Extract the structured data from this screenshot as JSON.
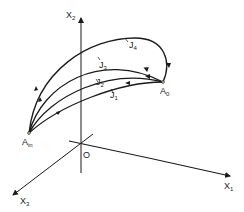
{
  "diagram": {
    "axes": {
      "x1": {
        "label": "X",
        "sub": "1"
      },
      "x2": {
        "label": "X",
        "sub": "2"
      },
      "x3": {
        "label": "X",
        "sub": "3"
      },
      "origin": {
        "label": "O"
      }
    },
    "points": {
      "a_in": {
        "label": "A",
        "sub": "in"
      },
      "a_0": {
        "label": "A",
        "sub": "0"
      }
    },
    "curves": [
      {
        "label": "J",
        "sub": "1"
      },
      {
        "label": "J",
        "sub": "2"
      },
      {
        "label": "J",
        "sub": "3"
      },
      {
        "label": "J",
        "sub": "4"
      }
    ],
    "colors": {
      "stroke": "#1a1a1a",
      "background": "#ffffff"
    }
  }
}
